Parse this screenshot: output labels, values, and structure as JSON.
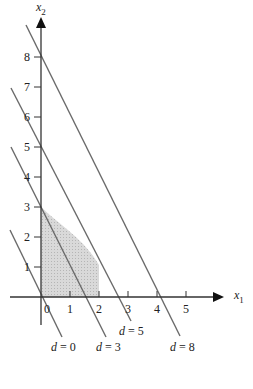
{
  "diagram": {
    "type": "linear-programming-isoprofit",
    "axes": {
      "x": {
        "label": "x",
        "subscript": "1",
        "ticks": [
          "0",
          "1",
          "2",
          "3",
          "4",
          "5"
        ]
      },
      "y": {
        "label": "x",
        "subscript": "2",
        "ticks": [
          "1",
          "2",
          "3",
          "4",
          "5",
          "6",
          "7",
          "8"
        ]
      }
    },
    "lines": [
      {
        "label_var": "d",
        "label_eq": " = 0",
        "value": 0
      },
      {
        "label_var": "d",
        "label_eq": " = 3",
        "value": 3
      },
      {
        "label_var": "d",
        "label_eq": " = 5",
        "value": 5
      },
      {
        "label_var": "d",
        "label_eq": " = 8",
        "value": 8
      }
    ],
    "line_equation": "2x1 + x2 = d",
    "feasible_region": {
      "fill": "#cfcfcf",
      "description": "shaded region bounded by axes, vertex (0,3), curving to x1=2"
    },
    "colors": {
      "axis": "#333333",
      "line": "#666666",
      "shade": "#cfcfcf"
    }
  }
}
